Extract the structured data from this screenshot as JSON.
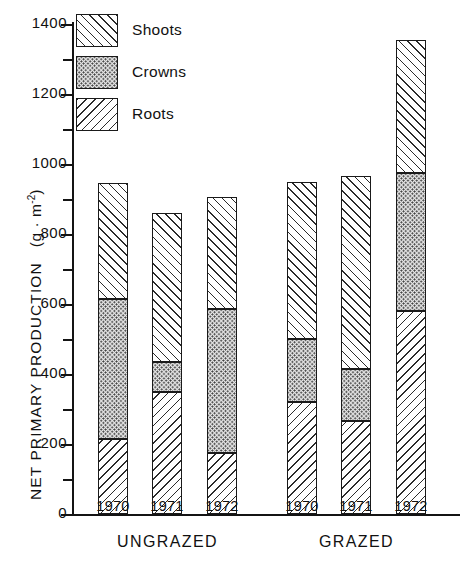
{
  "chart_data": {
    "type": "bar",
    "subtype": "stacked",
    "title": "",
    "xlabel": "",
    "ylabel": "NET PRIMARY PRODUCTION  (g · m⁻²)",
    "ylabel_main": "NET PRIMARY PRODUCTION",
    "ylabel_unit_prefix": "(g · m",
    "ylabel_unit_exp": "-2",
    "ylabel_unit_suffix": ")",
    "ylim": [
      0,
      1400
    ],
    "ytick_major": [
      0,
      200,
      400,
      600,
      800,
      1000,
      1200,
      1400
    ],
    "ytick_labels": [
      "0",
      "200",
      "400",
      "600",
      "800",
      "1000",
      "1200",
      "1400"
    ],
    "ytick_minor": [
      100,
      300,
      500,
      700,
      900,
      1100,
      1300
    ],
    "grid": false,
    "legend_position": "top-left",
    "categories": [
      "1970",
      "1971",
      "1972",
      "1970",
      "1971",
      "1972"
    ],
    "groups": [
      {
        "label": "UNGRAZED",
        "categories": [
          "1970",
          "1971",
          "1972"
        ]
      },
      {
        "label": "GRAZED",
        "categories": [
          "1970",
          "1971",
          "1972"
        ]
      }
    ],
    "series": [
      {
        "name": "Roots",
        "pattern": "back-diagonal-hatch",
        "values": [
          215,
          350,
          175,
          320,
          265,
          580
        ]
      },
      {
        "name": "Crowns",
        "pattern": "stipple-dots",
        "values": [
          400,
          85,
          410,
          180,
          150,
          395
        ]
      },
      {
        "name": "Shoots",
        "pattern": "forward-diagonal-hatch",
        "values": [
          330,
          425,
          320,
          450,
          550,
          380
        ]
      }
    ],
    "totals": [
      945,
      860,
      905,
      950,
      965,
      1355
    ],
    "bars": [
      {
        "group": "UNGRAZED",
        "year": "1970",
        "roots": 215,
        "crowns": 400,
        "shoots": 330,
        "total": 945
      },
      {
        "group": "UNGRAZED",
        "year": "1971",
        "roots": 350,
        "crowns": 85,
        "shoots": 425,
        "total": 860
      },
      {
        "group": "UNGRAZED",
        "year": "1972",
        "roots": 175,
        "crowns": 410,
        "shoots": 320,
        "total": 905
      },
      {
        "group": "GRAZED",
        "year": "1970",
        "roots": 320,
        "crowns": 180,
        "shoots": 450,
        "total": 950
      },
      {
        "group": "GRAZED",
        "year": "1971",
        "roots": 265,
        "crowns": 150,
        "shoots": 550,
        "total": 965
      },
      {
        "group": "GRAZED",
        "year": "1972",
        "roots": 580,
        "crowns": 395,
        "shoots": 380,
        "total": 1355
      }
    ],
    "legend": [
      {
        "label": "Shoots",
        "pattern": "forward-diagonal-hatch"
      },
      {
        "label": "Crowns",
        "pattern": "stipple-dots"
      },
      {
        "label": "Roots",
        "pattern": "back-diagonal-hatch"
      }
    ],
    "colors": {
      "ink": "#1a1a1a",
      "background": "#ffffff",
      "crown_fill": "#e4e4e4"
    }
  }
}
